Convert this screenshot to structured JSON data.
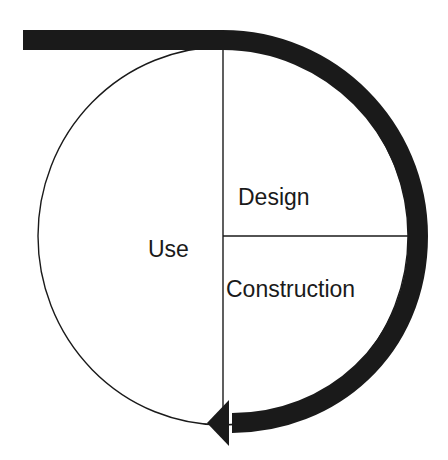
{
  "diagram": {
    "type": "cycle",
    "labels": {
      "design": "Design",
      "construction": "Construction",
      "use": "Use"
    },
    "colors": {
      "stroke": "#1a1a1a",
      "background": "#ffffff"
    }
  }
}
